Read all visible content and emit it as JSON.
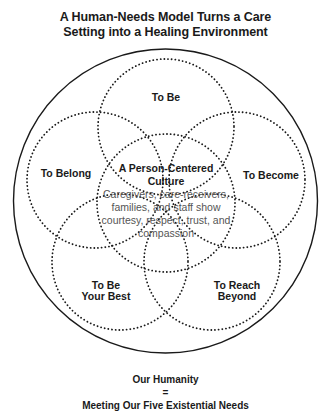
{
  "title": {
    "line1": "A Human-Needs Model Turns a Care",
    "line2": "Setting into a Healing Environment"
  },
  "center": {
    "title_line1": "A Person-Centered",
    "title_line2": "Culture",
    "description": "Caregivers, care-receivers, families, and staff show courtesy, respect, trust, and compassion"
  },
  "needs": {
    "to_be": "To Be",
    "to_become": "To Become",
    "to_belong": "To Belong",
    "to_be_your_best_line1": "To Be",
    "to_be_your_best_line2": "Your Best",
    "to_reach_beyond_line1": "To Reach",
    "to_reach_beyond_line2": "Beyond"
  },
  "footer": {
    "line1": "Our Humanity",
    "line2": "=",
    "line3": "Meeting Our Five Existential Needs"
  },
  "colors": {
    "stroke": "#1a1a1a",
    "text": "#1a1a1a",
    "description_text": "#555555"
  }
}
